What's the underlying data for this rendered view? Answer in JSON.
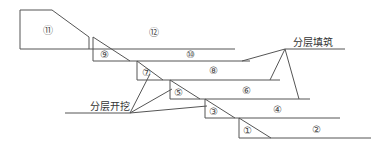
{
  "diagram": {
    "line_color": "#555555",
    "labels": {
      "b1": "①",
      "b2": "②",
      "b3": "③",
      "b4": "④",
      "b5": "⑤",
      "b6": "⑥",
      "b7": "⑦",
      "b8": "⑧",
      "b9": "⑨",
      "b10": "⑩",
      "b11": "⑪",
      "b12": "⑫"
    },
    "annotations": {
      "fill": "分层填筑",
      "excavate": "分层开挖"
    }
  }
}
